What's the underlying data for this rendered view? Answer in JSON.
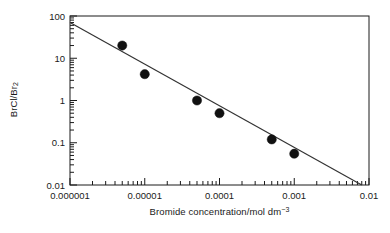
{
  "chart_data": {
    "type": "scatter",
    "title": "",
    "xlabel": "Bromide concentration/mol dm−3",
    "ylabel": "BrCl/Br2",
    "xscale": "log",
    "yscale": "log",
    "xlim": [
      1e-06,
      0.01
    ],
    "ylim": [
      0.01,
      100
    ],
    "grid": false,
    "legend": null,
    "xticks": [
      "0.000001",
      "0.00001",
      "0.0001",
      "0.001",
      "0.01"
    ],
    "xtick_values": [
      1e-06,
      1e-05,
      0.0001,
      0.001,
      0.01
    ],
    "yticks": [
      "100",
      "10",
      "1",
      "0.1",
      "0.01"
    ],
    "ytick_values": [
      100,
      10,
      1,
      0.1,
      0.01
    ],
    "minor_ticks": true,
    "marker": "filled-circle",
    "marker_color": "#111111",
    "line_color": "#333333",
    "series": [
      {
        "name": "BrCl/Br2 data",
        "type": "scatter",
        "x": [
          5e-06,
          1e-05,
          5e-05,
          0.0001,
          0.0005,
          0.001
        ],
        "y": [
          20,
          4.2,
          1.0,
          0.5,
          0.12,
          0.055
        ]
      },
      {
        "name": "fit line",
        "type": "line",
        "x": [
          1e-06,
          0.008
        ],
        "y": [
          70,
          0.01
        ]
      }
    ]
  },
  "axis": {
    "y_label_main": "BrCl/Br",
    "y_label_sub": "2",
    "x_label_main": "Bromide concentration/mol dm",
    "x_label_sup": "−3"
  },
  "colors": {
    "frame": "#1a1a1a",
    "marker": "#111111",
    "fit_line": "#333333",
    "background": "#ffffff",
    "text": "#1a1a1a"
  }
}
